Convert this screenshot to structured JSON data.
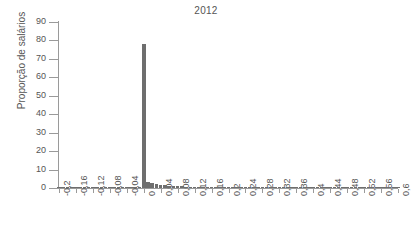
{
  "chart_data": {
    "type": "bar",
    "title": "2012",
    "subtitle": "",
    "xlabel": "",
    "ylabel": "Proporção de salários",
    "xlim": [
      -0.2,
      0.6
    ],
    "ylim": [
      0,
      90
    ],
    "grid": false,
    "legend": null,
    "bar_color": "#6e6e6e",
    "axis_color": "#9a9a9a",
    "text_color": "#555555",
    "bin_width": 0.01,
    "xtick_labels": [
      "-0,2",
      "-0,16",
      "-0,12",
      "-0,08",
      "-0,04",
      "0",
      "0,04",
      "0,08",
      "0,12",
      "0,16",
      "0,2",
      "0,24",
      "0,28",
      "0,32",
      "0,36",
      "0,4",
      "0,44",
      "0,48",
      "0,52",
      "0,56",
      "0,6"
    ],
    "xtick_values": [
      -0.2,
      -0.16,
      -0.12,
      -0.08,
      -0.04,
      0,
      0.04,
      0.08,
      0.12,
      0.16,
      0.2,
      0.24,
      0.28,
      0.32,
      0.36,
      0.4,
      0.44,
      0.48,
      0.52,
      0.56,
      0.6
    ],
    "ytick_labels": [
      "0",
      "10",
      "20",
      "30",
      "40",
      "50",
      "60",
      "70",
      "80",
      "90"
    ],
    "ytick_values": [
      0,
      10,
      20,
      30,
      40,
      50,
      60,
      70,
      80,
      90
    ],
    "x": [
      -0.2,
      -0.19,
      -0.18,
      -0.17,
      -0.16,
      -0.15,
      -0.14,
      -0.13,
      -0.12,
      -0.11,
      -0.1,
      -0.09,
      -0.08,
      -0.07,
      -0.06,
      -0.05,
      -0.04,
      -0.03,
      -0.02,
      -0.01,
      0,
      0.01,
      0.02,
      0.03,
      0.04,
      0.05,
      0.06,
      0.07,
      0.08,
      0.09,
      0.1,
      0.11,
      0.12,
      0.13,
      0.14,
      0.15,
      0.16,
      0.17,
      0.18,
      0.19,
      0.2,
      0.21,
      0.22,
      0.23,
      0.24,
      0.25,
      0.26,
      0.27,
      0.28,
      0.29,
      0.3,
      0.31,
      0.32,
      0.33,
      0.34,
      0.35,
      0.36,
      0.37,
      0.38,
      0.39,
      0.4,
      0.41,
      0.42,
      0.43,
      0.44,
      0.45,
      0.46,
      0.47,
      0.48,
      0.49,
      0.5,
      0.51,
      0.52,
      0.53,
      0.54,
      0.55,
      0.56,
      0.57,
      0.58,
      0.59,
      0.6
    ],
    "values": [
      0.7,
      0.1,
      0.05,
      0.05,
      0.1,
      0.05,
      0.05,
      0.05,
      0.1,
      0.05,
      0.05,
      0.05,
      0.1,
      0.05,
      0.05,
      0.1,
      0.15,
      0.2,
      0.3,
      0.5,
      78,
      3.2,
      2.6,
      2.2,
      1.8,
      1.5,
      1.3,
      1.1,
      1.0,
      0.9,
      0.8,
      0.7,
      0.6,
      0.55,
      0.5,
      0.45,
      0.4,
      0.38,
      0.35,
      0.32,
      0.3,
      0.28,
      0.25,
      0.24,
      0.22,
      0.2,
      0.19,
      0.18,
      0.17,
      0.16,
      0.15,
      0.14,
      0.13,
      0.12,
      0.12,
      0.11,
      0.1,
      0.1,
      0.09,
      0.09,
      0.08,
      0.08,
      0.07,
      0.07,
      0.06,
      0.06,
      0.06,
      0.05,
      0.05,
      0.05,
      0.05,
      0.04,
      0.04,
      0.04,
      0.04,
      0.03,
      0.03,
      0.03,
      0.03,
      0.03,
      0.02
    ]
  }
}
